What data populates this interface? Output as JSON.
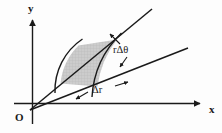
{
  "figure": {
    "background_color": "#fdfdfd",
    "stroke_color": "#1a1a1a",
    "shaded_fill_color": "#cccccc",
    "axes": {
      "y_label": "y",
      "x_label": "x",
      "origin_label": "O",
      "x_axis": {
        "x1": 14,
        "y1": 103,
        "x2": 204,
        "y2": 103
      },
      "y_axis": {
        "x1": 32,
        "y1": 122,
        "x2": 32,
        "y2": 17
      }
    },
    "rays": [
      {
        "name": "upper-ray",
        "angle_deg": 41,
        "x1": 30,
        "y1": 110,
        "x2": 152,
        "y2": 9
      },
      {
        "name": "lower-ray",
        "angle_deg": 21,
        "x1": 30,
        "y1": 110,
        "x2": 188,
        "y2": 48
      }
    ],
    "arcs": [
      {
        "name": "inner-arc",
        "radius": 62,
        "x1": 60,
        "y1": 83,
        "x2": 78,
        "y2": 45
      },
      {
        "name": "outer-arc",
        "radius": 97,
        "x1": 97,
        "y1": 86,
        "x2": 117,
        "y2": 39
      }
    ],
    "annotations": [
      {
        "name": "arc-length-label",
        "text": "rΔθ",
        "meaning": "r delta theta"
      },
      {
        "name": "radial-thickness-label",
        "text": "Δr",
        "meaning": "delta r"
      }
    ],
    "shaded_region": {
      "name": "area-element",
      "description": "curvilinear quadrilateral bounded by two rays and two arcs",
      "fill": "#cccccc",
      "texture": "fine grid"
    }
  }
}
